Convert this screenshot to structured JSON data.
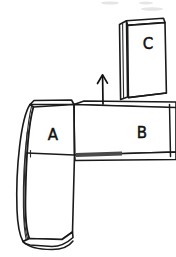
{
  "scene": {
    "title": "Hand-drawn sketch of three stacked blocks",
    "background_color": "#ffffff",
    "ink_color": "#1a1a1a",
    "width": 176,
    "height": 257
  },
  "blocks": [
    {
      "id": "block-a",
      "label": "A",
      "label_x": 53,
      "label_y": 135,
      "orientation": "vertical",
      "position": "left",
      "description": "Tall upright block on the left, front face with narrow curved left side face"
    },
    {
      "id": "block-b",
      "label": "B",
      "label_x": 142,
      "label_y": 133,
      "orientation": "horizontal",
      "position": "center-right",
      "description": "Horizontal block lying flat, extends off the right edge"
    },
    {
      "id": "block-c",
      "label": "C",
      "label_x": 148,
      "label_y": 44,
      "orientation": "vertical",
      "position": "top-right",
      "description": "Upright block standing on top of block B"
    }
  ],
  "annotations": [
    {
      "id": "motion-arrow",
      "type": "arrow",
      "direction": "up",
      "tip_x": 103,
      "tip_y": 75,
      "tail_x": 103,
      "tail_y": 104,
      "description": "Upward pointing arrow between block A and block C indicating motion"
    }
  ]
}
